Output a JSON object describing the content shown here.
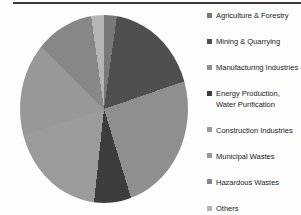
{
  "page": {
    "background_color": "#fdfdfd",
    "top_rule_color": "#3a3a3a"
  },
  "chart_data": {
    "type": "pie",
    "title": "",
    "legend_position": "right",
    "start_angle_deg": 0,
    "direction": "clockwise",
    "slices": [
      {
        "label": "Agriculture & Forestry",
        "value": 2.2,
        "color": "#787878"
      },
      {
        "label": "Mining & Quarrying",
        "value": 17.5,
        "color": "#4f4f4f"
      },
      {
        "label": "Manufacturing Industries",
        "value": 25.6,
        "color": "#8f8f8f"
      },
      {
        "label": "Energy Production, Water Purification",
        "value": 6.4,
        "color": "#3d3d3d"
      },
      {
        "label": "Construction Industries",
        "value": 18.3,
        "color": "#9b9b9b"
      },
      {
        "label": "Municipal Wastes",
        "value": 17.5,
        "color": "#989898"
      },
      {
        "label": "Hazardous Wastes",
        "value": 10.3,
        "color": "#878787"
      },
      {
        "label": "Others",
        "value": 2.2,
        "color": "#b4b4b4"
      }
    ],
    "legend_text_color": "#1a1a1a"
  }
}
